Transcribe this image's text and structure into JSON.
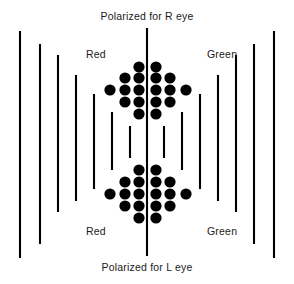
{
  "figure": {
    "title_top": "Polarized for R eye",
    "title_bottom": "Polarized for L eye",
    "label_red_top": "Red",
    "label_red_bottom": "Red",
    "label_green_top": "Green",
    "label_green_bottom": "Green",
    "background_color": "#ffffff",
    "ink_color": "#000000",
    "text_color": "#1a1a1a"
  },
  "chart_data": {
    "type": "scatter",
    "title": "Polarized for R eye",
    "subtitle": "Polarized for L eye",
    "xlabel": "",
    "ylabel": "",
    "xlim": [
      0,
      294
    ],
    "ylim": [
      0,
      284
    ],
    "grid": false,
    "legend": "none",
    "annotations": [
      {
        "text": "Polarized for R eye",
        "x": 147,
        "y": 17,
        "align": "center"
      },
      {
        "text": "Red",
        "x": 86,
        "y": 55,
        "align": "left"
      },
      {
        "text": "Green",
        "x": 207,
        "y": 55,
        "align": "left"
      },
      {
        "text": "Red",
        "x": 86,
        "y": 232,
        "align": "left"
      },
      {
        "text": "Green",
        "x": 207,
        "y": 232,
        "align": "left"
      },
      {
        "text": "Polarized for L eye",
        "x": 147,
        "y": 268,
        "align": "center"
      }
    ],
    "series": [
      {
        "name": "polarizer-lines",
        "type": "vertical-line-segments",
        "stroke_width": 2.1,
        "color": "#000000",
        "note": "Vertical bars; length shortens toward the centre, centre divider is longest",
        "values": [
          {
            "id": "line-L1",
            "x": 20,
            "y_top": 31,
            "y_bottom": 258,
            "side": "left"
          },
          {
            "id": "line-L2",
            "x": 40,
            "y_top": 44,
            "y_bottom": 244,
            "side": "left"
          },
          {
            "id": "line-L3",
            "x": 58,
            "y_top": 55,
            "y_bottom": 212,
            "side": "left"
          },
          {
            "id": "line-L4",
            "x": 76,
            "y_top": 75,
            "y_bottom": 201,
            "side": "left"
          },
          {
            "id": "line-L5",
            "x": 94,
            "y_top": 94,
            "y_bottom": 189,
            "side": "left"
          },
          {
            "id": "line-L6",
            "x": 112,
            "y_top": 112,
            "y_bottom": 170,
            "side": "left"
          },
          {
            "id": "line-L7",
            "x": 130,
            "y_top": 126,
            "y_bottom": 158,
            "side": "left"
          },
          {
            "id": "line-C",
            "x": 147,
            "y_top": 28,
            "y_bottom": 256,
            "side": "center"
          },
          {
            "id": "line-R7",
            "x": 164,
            "y_top": 126,
            "y_bottom": 158,
            "side": "right"
          },
          {
            "id": "line-R6",
            "x": 182,
            "y_top": 112,
            "y_bottom": 170,
            "side": "right"
          },
          {
            "id": "line-R5",
            "x": 200,
            "y_top": 94,
            "y_bottom": 189,
            "side": "right"
          },
          {
            "id": "line-R4",
            "x": 218,
            "y_top": 75,
            "y_bottom": 201,
            "side": "right"
          },
          {
            "id": "line-R3",
            "x": 236,
            "y_top": 55,
            "y_bottom": 212,
            "side": "right"
          },
          {
            "id": "line-R2",
            "x": 254,
            "y_top": 44,
            "y_bottom": 244,
            "side": "right"
          },
          {
            "id": "line-R1",
            "x": 274,
            "y_top": 31,
            "y_bottom": 258,
            "side": "right"
          }
        ]
      },
      {
        "name": "dot-cluster",
        "type": "filled-circles",
        "color": "#000000",
        "radius": 5.6,
        "note": "Diamond / hourglass arrangement of dots straddling the centre line",
        "values": [
          {
            "x": 139,
            "y": 67
          },
          {
            "x": 156,
            "y": 67
          },
          {
            "x": 125,
            "y": 78
          },
          {
            "x": 139,
            "y": 78
          },
          {
            "x": 156,
            "y": 78
          },
          {
            "x": 170,
            "y": 78
          },
          {
            "x": 110,
            "y": 90
          },
          {
            "x": 125,
            "y": 90
          },
          {
            "x": 139,
            "y": 90
          },
          {
            "x": 156,
            "y": 90
          },
          {
            "x": 170,
            "y": 90
          },
          {
            "x": 186,
            "y": 90
          },
          {
            "x": 125,
            "y": 102
          },
          {
            "x": 139,
            "y": 102
          },
          {
            "x": 156,
            "y": 102
          },
          {
            "x": 170,
            "y": 102
          },
          {
            "x": 139,
            "y": 114
          },
          {
            "x": 156,
            "y": 114
          },
          {
            "x": 139,
            "y": 170
          },
          {
            "x": 156,
            "y": 170
          },
          {
            "x": 125,
            "y": 182
          },
          {
            "x": 139,
            "y": 182
          },
          {
            "x": 156,
            "y": 182
          },
          {
            "x": 170,
            "y": 182
          },
          {
            "x": 110,
            "y": 194
          },
          {
            "x": 125,
            "y": 194
          },
          {
            "x": 139,
            "y": 194
          },
          {
            "x": 156,
            "y": 194
          },
          {
            "x": 170,
            "y": 194
          },
          {
            "x": 186,
            "y": 194
          },
          {
            "x": 125,
            "y": 206
          },
          {
            "x": 139,
            "y": 206
          },
          {
            "x": 156,
            "y": 206
          },
          {
            "x": 170,
            "y": 206
          },
          {
            "x": 139,
            "y": 218
          },
          {
            "x": 156,
            "y": 218
          }
        ]
      }
    ]
  }
}
